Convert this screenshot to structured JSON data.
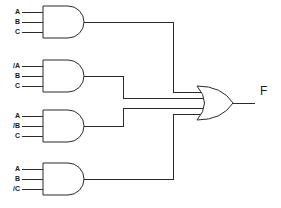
{
  "diagram": {
    "type": "logic-circuit",
    "line_color": "#2b2b2b",
    "background_color": "#ffffff",
    "output": {
      "label": "F",
      "name": "output-f"
    },
    "or_gate": {
      "label": "",
      "type": "OR",
      "inputs": 4
    },
    "and_gates": [
      {
        "id": "and-gate-1",
        "type": "AND",
        "inputs": [
          "A",
          "B",
          "C"
        ]
      },
      {
        "id": "and-gate-2",
        "type": "AND",
        "inputs": [
          "/A",
          "B",
          "C"
        ]
      },
      {
        "id": "and-gate-3",
        "type": "AND",
        "inputs": [
          "A",
          "/B",
          "C"
        ]
      },
      {
        "id": "and-gate-4",
        "type": "AND",
        "inputs": [
          "A",
          "B",
          "/C"
        ]
      }
    ]
  }
}
